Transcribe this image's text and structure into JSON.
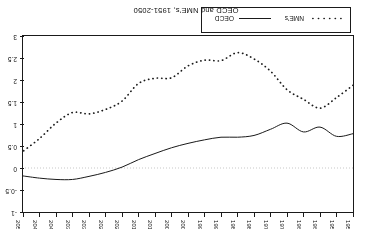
{
  "chart_data": {
    "type": "line",
    "title": "OECD and NME's, 1951-2050",
    "xlabel": "",
    "ylabel": "",
    "orientation": "rotated-180",
    "grid": false,
    "zero_line": true,
    "legend_position": "bottom-left",
    "xlim": [
      1950,
      2050
    ],
    "ylim": [
      -1,
      3
    ],
    "y_ticks": [
      "-1",
      "-0.5",
      "0",
      "0.5",
      "1",
      "1.5",
      "2",
      "2.5",
      "3"
    ],
    "y_tick_values": [
      -1,
      -0.5,
      0,
      0.5,
      1,
      1.5,
      2,
      2.5,
      3
    ],
    "x_ticks": [
      "1950",
      "1955",
      "1960",
      "1965",
      "1970",
      "1975",
      "1980",
      "1985",
      "1990",
      "1995",
      "2000",
      "2005",
      "2010",
      "2015",
      "2020",
      "2025",
      "2030",
      "2035",
      "2040",
      "2045",
      "2050"
    ],
    "x": [
      1950,
      1955,
      1960,
      1965,
      1970,
      1975,
      1980,
      1985,
      1990,
      1995,
      2000,
      2005,
      2010,
      2015,
      2020,
      2025,
      2030,
      2035,
      2040,
      2045,
      2050
    ],
    "series": [
      {
        "name": "OECD",
        "style": "solid",
        "color": "#1a1a1a",
        "values": [
          0.78,
          0.72,
          0.93,
          0.82,
          1.02,
          0.88,
          0.74,
          0.7,
          0.7,
          0.64,
          0.56,
          0.46,
          0.33,
          0.19,
          0.02,
          -0.1,
          -0.19,
          -0.26,
          -0.26,
          -0.23,
          -0.18
        ]
      },
      {
        "name": "NME's",
        "style": "dotted",
        "color": "#1a1a1a",
        "values": [
          1.88,
          1.6,
          1.36,
          1.56,
          1.78,
          2.2,
          2.48,
          2.62,
          2.44,
          2.45,
          2.32,
          2.05,
          2.04,
          1.92,
          1.52,
          1.33,
          1.23,
          1.26,
          1.02,
          0.67,
          0.38
        ]
      }
    ]
  },
  "legend": {
    "entries": [
      {
        "label": "NME's",
        "style": "dotted"
      },
      {
        "label": "OECD",
        "style": "solid"
      }
    ]
  }
}
